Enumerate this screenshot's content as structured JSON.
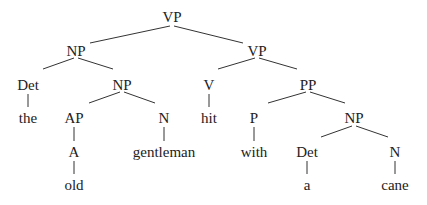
{
  "diagram": {
    "type": "syntax-tree",
    "colors": {
      "text": "#222222",
      "lines": "#333333",
      "background": "#ffffff"
    },
    "nodes": [
      {
        "id": "vp0",
        "label": "VP",
        "x": 172,
        "y": 17
      },
      {
        "id": "np1",
        "label": "NP",
        "x": 76,
        "y": 51
      },
      {
        "id": "vp1",
        "label": "VP",
        "x": 257,
        "y": 51
      },
      {
        "id": "det1",
        "label": "Det",
        "x": 28,
        "y": 85
      },
      {
        "id": "np2",
        "label": "NP",
        "x": 122,
        "y": 85
      },
      {
        "id": "the",
        "label": "the",
        "x": 28,
        "y": 118
      },
      {
        "id": "ap",
        "label": "AP",
        "x": 74,
        "y": 118
      },
      {
        "id": "n1",
        "label": "N",
        "x": 164,
        "y": 118
      },
      {
        "id": "a_adj",
        "label": "A",
        "x": 74,
        "y": 152
      },
      {
        "id": "gentleman",
        "label": "gentleman",
        "x": 164,
        "y": 152
      },
      {
        "id": "old",
        "label": "old",
        "x": 74,
        "y": 185
      },
      {
        "id": "v",
        "label": "V",
        "x": 209,
        "y": 85
      },
      {
        "id": "hit",
        "label": "hit",
        "x": 209,
        "y": 118
      },
      {
        "id": "pp",
        "label": "PP",
        "x": 308,
        "y": 85
      },
      {
        "id": "p",
        "label": "P",
        "x": 254,
        "y": 118
      },
      {
        "id": "with",
        "label": "with",
        "x": 254,
        "y": 152
      },
      {
        "id": "np3",
        "label": "NP",
        "x": 354,
        "y": 118
      },
      {
        "id": "det2",
        "label": "Det",
        "x": 307,
        "y": 152
      },
      {
        "id": "a_det",
        "label": "a",
        "x": 307,
        "y": 185
      },
      {
        "id": "n2",
        "label": "N",
        "x": 395,
        "y": 152
      },
      {
        "id": "cane",
        "label": "cane",
        "x": 395,
        "y": 185
      }
    ],
    "edges": [
      {
        "from": "vp0",
        "to": "np1",
        "x1": 170,
        "y1": 26,
        "x2": 90,
        "y2": 43
      },
      {
        "from": "vp0",
        "to": "vp1",
        "x1": 174,
        "y1": 26,
        "x2": 243,
        "y2": 43
      },
      {
        "from": "np1",
        "to": "det1",
        "x1": 74,
        "y1": 58,
        "x2": 43,
        "y2": 69
      },
      {
        "from": "np1",
        "to": "np2",
        "x1": 78,
        "y1": 58,
        "x2": 113,
        "y2": 69
      },
      {
        "from": "det1",
        "to": "the",
        "x1": 28,
        "y1": 94,
        "x2": 28,
        "y2": 107
      },
      {
        "from": "np2",
        "to": "ap",
        "x1": 120,
        "y1": 92,
        "x2": 89,
        "y2": 103
      },
      {
        "from": "np2",
        "to": "n1",
        "x1": 124,
        "y1": 92,
        "x2": 155,
        "y2": 103
      },
      {
        "from": "ap",
        "to": "a_adj",
        "x1": 74,
        "y1": 127,
        "x2": 74,
        "y2": 141
      },
      {
        "from": "a_adj",
        "to": "old",
        "x1": 74,
        "y1": 161,
        "x2": 74,
        "y2": 174
      },
      {
        "from": "n1",
        "to": "gentleman",
        "x1": 164,
        "y1": 127,
        "x2": 164,
        "y2": 141
      },
      {
        "from": "vp1",
        "to": "v",
        "x1": 255,
        "y1": 58,
        "x2": 218,
        "y2": 69
      },
      {
        "from": "vp1",
        "to": "pp",
        "x1": 259,
        "y1": 58,
        "x2": 297,
        "y2": 69
      },
      {
        "from": "v",
        "to": "hit",
        "x1": 209,
        "y1": 94,
        "x2": 209,
        "y2": 107
      },
      {
        "from": "pp",
        "to": "p",
        "x1": 306,
        "y1": 92,
        "x2": 268,
        "y2": 103
      },
      {
        "from": "pp",
        "to": "np3",
        "x1": 310,
        "y1": 92,
        "x2": 345,
        "y2": 103
      },
      {
        "from": "p",
        "to": "with",
        "x1": 254,
        "y1": 127,
        "x2": 254,
        "y2": 141
      },
      {
        "from": "np3",
        "to": "det2",
        "x1": 352,
        "y1": 126,
        "x2": 321,
        "y2": 137
      },
      {
        "from": "np3",
        "to": "n2",
        "x1": 356,
        "y1": 126,
        "x2": 388,
        "y2": 137
      },
      {
        "from": "det2",
        "to": "a_det",
        "x1": 307,
        "y1": 161,
        "x2": 307,
        "y2": 174
      },
      {
        "from": "n2",
        "to": "cane",
        "x1": 395,
        "y1": 161,
        "x2": 395,
        "y2": 174
      }
    ]
  }
}
